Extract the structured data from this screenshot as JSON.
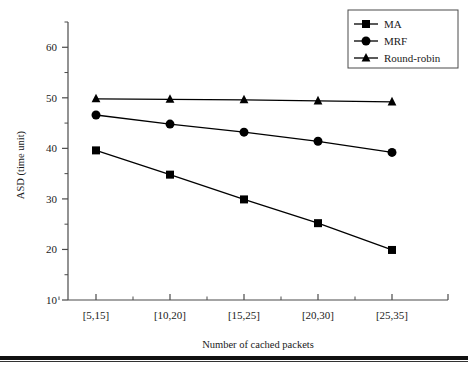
{
  "chart_data": {
    "type": "line",
    "title": "",
    "xlabel": "Number of cached packets",
    "ylabel": "ASD (time unit)",
    "categories": [
      "[5,15]",
      "[10,20]",
      "[15,25]",
      "[20,30]",
      "[25,35]"
    ],
    "ylim": [
      10,
      65
    ],
    "yticks": [
      10,
      20,
      30,
      40,
      50,
      60
    ],
    "ytick_labels": [
      "10",
      "20",
      "30",
      "40",
      "50",
      "60"
    ],
    "minor_yticks": [
      15,
      25,
      35,
      45,
      55,
      65
    ],
    "grid": false,
    "legend_position": "top-right",
    "series": [
      {
        "name": "MA",
        "marker": "square",
        "color": "#000000",
        "values": [
          39.6,
          34.8,
          29.9,
          25.2,
          19.9
        ]
      },
      {
        "name": "MRF",
        "marker": "circle",
        "color": "#000000",
        "values": [
          46.6,
          44.8,
          43.2,
          41.4,
          39.2
        ]
      },
      {
        "name": "Round-robin",
        "marker": "triangle",
        "color": "#000000",
        "values": [
          49.8,
          49.7,
          49.6,
          49.4,
          49.2
        ]
      }
    ]
  },
  "legend": {
    "entries": [
      {
        "label": "MA",
        "marker": "square"
      },
      {
        "label": "MRF",
        "marker": "circle"
      },
      {
        "label": "Round-robin",
        "marker": "triangle"
      }
    ]
  },
  "axes": {
    "y_title": "ASD (time unit)",
    "x_title": "Number of cached packets"
  }
}
